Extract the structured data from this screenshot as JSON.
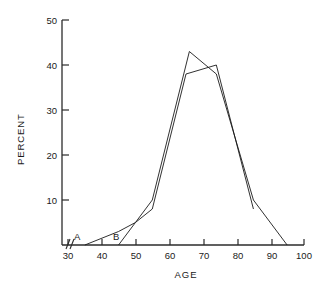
{
  "chart_data": {
    "type": "line",
    "title": "",
    "xlabel": "AGE",
    "ylabel": "PERCENT",
    "xlim": [
      30,
      100
    ],
    "ylim": [
      0,
      50
    ],
    "xticks": [
      30,
      40,
      50,
      60,
      70,
      80,
      90,
      100
    ],
    "yticks": [
      10,
      20,
      30,
      40,
      50
    ],
    "grid": false,
    "legend_position": "inline-annotation",
    "axis_break": "x-axis origin break",
    "series": [
      {
        "name": "A",
        "label": "A",
        "x": [
          35,
          45,
          50,
          55,
          66,
          74,
          85,
          95
        ],
        "values": [
          0,
          3,
          5,
          10,
          43,
          38,
          10,
          0
        ]
      },
      {
        "name": "B",
        "label": "B",
        "x": [
          45,
          50,
          55,
          65,
          74,
          85
        ],
        "values": [
          0,
          5,
          8,
          38,
          40,
          8
        ]
      }
    ]
  },
  "annotations": {
    "series_a_label": "A",
    "series_b_label": "B"
  },
  "axis": {
    "y_title": "PERCENT",
    "x_title": "AGE",
    "ytick_labels": [
      "10",
      "20",
      "30",
      "40",
      "50"
    ],
    "xtick_labels": [
      "30",
      "40",
      "50",
      "60",
      "70",
      "80",
      "90",
      "100"
    ]
  },
  "colors": {
    "line": "#1a1a1a",
    "axis": "#2b2b2b",
    "background": "#ffffff"
  }
}
